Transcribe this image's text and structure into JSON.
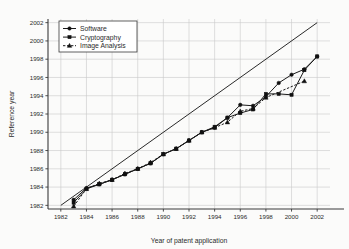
{
  "chart_data": {
    "type": "line",
    "title": "",
    "xlabel": "Year of patent application",
    "ylabel": "Reference year",
    "xlim": [
      1981,
      2003
    ],
    "ylim": [
      1981.6,
      2002.4
    ],
    "xticks": [
      1982,
      1984,
      1986,
      1988,
      1990,
      1992,
      1994,
      1996,
      1998,
      2000,
      2002
    ],
    "yticks": [
      1982,
      1984,
      1986,
      1988,
      1990,
      1992,
      1994,
      1996,
      1998,
      2000,
      2002
    ],
    "grid": true,
    "legend_position": "top-left",
    "annotations": [
      {
        "name": "diagonal-reference-line",
        "description": "y = x reference line",
        "from": [
          1982,
          1982
        ],
        "to": [
          2002,
          2002
        ]
      }
    ],
    "series": [
      {
        "name": "Software",
        "marker": "circle",
        "linestyle": "solid",
        "color": "#111111",
        "x": [
          1983,
          1984,
          1985,
          1986,
          1987,
          1988,
          1989,
          1990,
          1991,
          1992,
          1993,
          1994,
          1995,
          1996,
          1997,
          1998,
          1999,
          2000,
          2001,
          2002
        ],
        "y": [
          1982.6,
          1983.9,
          1984.3,
          1984.8,
          1985.4,
          1986.0,
          1986.6,
          1987.6,
          1988.2,
          1989.1,
          1990.0,
          1990.5,
          1991.6,
          1993.0,
          1992.9,
          1993.9,
          1995.4,
          1996.3,
          1996.9,
          1998.3
        ]
      },
      {
        "name": "Cryptography",
        "marker": "square",
        "linestyle": "solid",
        "color": "#111111",
        "x": [
          1983,
          1984,
          1985,
          1986,
          1987,
          1988,
          1989,
          1990,
          1991,
          1992,
          1993,
          1994,
          1995,
          1996,
          1997,
          1998,
          1999,
          2000,
          2001,
          2002
        ],
        "y": [
          1982.3,
          1983.8,
          1984.3,
          1984.8,
          1985.4,
          1986.0,
          1986.6,
          1987.6,
          1988.2,
          1989.1,
          1990.0,
          1990.6,
          1991.6,
          1992.1,
          1992.5,
          1994.2,
          1994.2,
          1994.1,
          1996.8,
          1998.3
        ]
      },
      {
        "name": "Image Analysis",
        "marker": "triangle",
        "linestyle": "dashed",
        "color": "#111111",
        "x": [
          1983,
          1984,
          1985,
          1986,
          1987,
          1988,
          1989,
          1990,
          1991,
          1992,
          1993,
          1994,
          1995,
          1996,
          1997,
          1998,
          2001
        ],
        "y": [
          1981.9,
          1983.8,
          1984.4,
          1984.8,
          1985.5,
          1986.0,
          1986.7,
          1987.6,
          1988.2,
          1989.1,
          1990.0,
          1990.5,
          1991.1,
          1992.3,
          1992.6,
          1993.8,
          1995.6
        ]
      }
    ],
    "legend_entries": [
      {
        "label": "Software",
        "marker": "circle",
        "linestyle": "solid"
      },
      {
        "label": "Cryptography",
        "marker": "square",
        "linestyle": "solid"
      },
      {
        "label": "Image Analysis",
        "marker": "triangle",
        "linestyle": "dashed"
      }
    ]
  }
}
